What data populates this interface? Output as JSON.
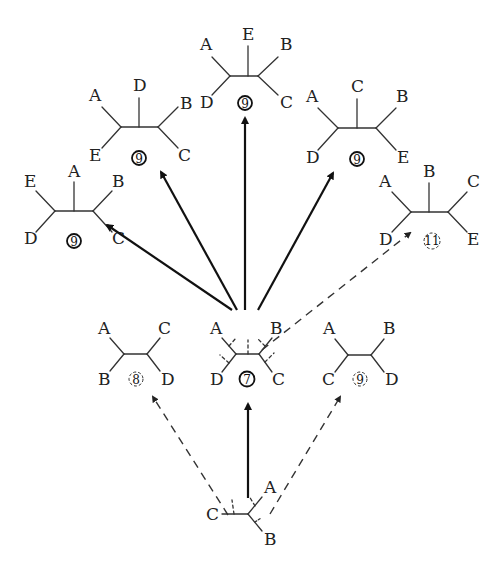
{
  "colors": {
    "line": "#333333",
    "text": "#222222",
    "background": "#ffffff"
  },
  "legend": {
    "solid_circle": "best (chosen) tree at each step",
    "dashed_circle": "rejected alternative tree",
    "solid_arrow": "path followed",
    "dashed_arrow": "path evaluated but not followed"
  },
  "trees": [
    {
      "id": "start",
      "taxa": [
        "A",
        "B",
        "C"
      ],
      "labels": {
        "a": "A",
        "b": "B",
        "c": "C"
      },
      "score": null
    },
    {
      "id": "four_left",
      "labels": {
        "tl": "A",
        "tr": "C",
        "bl": "B",
        "br": "D"
      },
      "score": "8",
      "chosen": false
    },
    {
      "id": "four_center",
      "labels": {
        "tl": "A",
        "tr": "B",
        "bl": "D",
        "br": "C"
      },
      "score": "7",
      "chosen": true
    },
    {
      "id": "four_right",
      "labels": {
        "tl": "A",
        "tr": "B",
        "bl": "C",
        "br": "D"
      },
      "score": "9",
      "chosen": false
    },
    {
      "id": "five_1",
      "labels": {
        "tl": "E",
        "top": "A",
        "tr": "B",
        "bl": "D",
        "br": "C"
      },
      "score": "9",
      "chosen": true
    },
    {
      "id": "five_2",
      "labels": {
        "tl": "A",
        "top": "D",
        "tr": "B",
        "bl": "E",
        "br": "C"
      },
      "score": "9",
      "chosen": true
    },
    {
      "id": "five_3",
      "labels": {
        "tl": "A",
        "top": "E",
        "tr": "B",
        "bl": "D",
        "br": "C"
      },
      "score": "9",
      "chosen": true
    },
    {
      "id": "five_4",
      "labels": {
        "tl": "A",
        "top": "C",
        "tr": "B",
        "bl": "D",
        "br": "E"
      },
      "score": "9",
      "chosen": true
    },
    {
      "id": "five_5",
      "labels": {
        "tl": "A",
        "top": "B",
        "tr": "C",
        "bl": "D",
        "br": "E"
      },
      "score": "11",
      "chosen": false
    }
  ]
}
